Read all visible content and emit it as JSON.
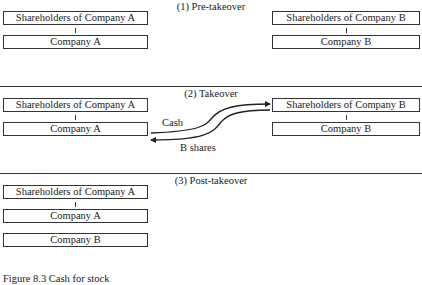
{
  "sections": {
    "pre": {
      "title": "(1) Pre-takeover",
      "left": {
        "shareholders": "Shareholders of Company A",
        "company": "Company A"
      },
      "right": {
        "shareholders": "Shareholders of Company B",
        "company": "Company B"
      }
    },
    "takeover": {
      "title": "(2) Takeover",
      "left": {
        "shareholders": "Shareholders of Company A",
        "company": "Company A"
      },
      "right": {
        "shareholders": "Shareholders of Company B",
        "company": "Company B"
      },
      "flows": {
        "cash": "Cash",
        "b_shares": "B shares"
      }
    },
    "post": {
      "title": "(3) Post-takeover",
      "shareholders": "Shareholders of Company A",
      "company_a": "Company A",
      "company_b": "Company B"
    }
  },
  "caption": "Figure 8.3 Cash for stock",
  "colors": {
    "line": "#333333",
    "text": "#1a1a1a",
    "background": "#ffffff"
  }
}
